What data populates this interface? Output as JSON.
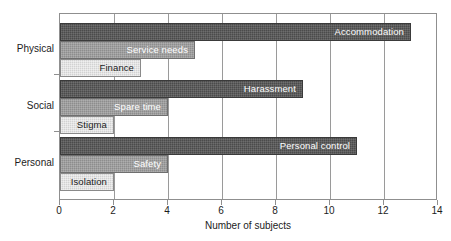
{
  "chart_data": {
    "type": "bar",
    "orientation": "horizontal",
    "title": "",
    "xlabel": "Number of subjects",
    "ylabel": "",
    "xlim": [
      0,
      14
    ],
    "xticks": [
      0,
      2,
      4,
      6,
      8,
      10,
      12,
      14
    ],
    "xticklabels": [
      "0",
      "2",
      "4",
      "6",
      "8",
      "10",
      "12",
      "14"
    ],
    "grid": "vertical",
    "legend": "none",
    "groups": [
      {
        "name": "Physical",
        "bars": [
          {
            "label": "Accommodation",
            "value": 13,
            "shade": "dark",
            "color": "#4b4b4b"
          },
          {
            "label": "Service needs",
            "value": 5,
            "shade": "mid",
            "color": "#8d8d8d"
          },
          {
            "label": "Finance",
            "value": 3,
            "shade": "light",
            "color": "#d2d2d2"
          }
        ]
      },
      {
        "name": "Social",
        "bars": [
          {
            "label": "Harassment",
            "value": 9,
            "shade": "dark",
            "color": "#4b4b4b"
          },
          {
            "label": "Spare time",
            "value": 4,
            "shade": "mid",
            "color": "#8d8d8d"
          },
          {
            "label": "Stigma",
            "value": 2,
            "shade": "light",
            "color": "#d2d2d2"
          }
        ]
      },
      {
        "name": "Personal",
        "bars": [
          {
            "label": "Personal control",
            "value": 11,
            "shade": "dark",
            "color": "#4b4b4b"
          },
          {
            "label": "Safety",
            "value": 4,
            "shade": "mid",
            "color": "#8d8d8d"
          },
          {
            "label": "Isolation",
            "value": 2,
            "shade": "light",
            "color": "#d2d2d2"
          }
        ]
      }
    ]
  },
  "axis": {
    "x_title": "Number of subjects",
    "tick_labels_x": [
      "0",
      "2",
      "4",
      "6",
      "8",
      "10",
      "12",
      "14"
    ],
    "category_labels": [
      "Physical",
      "Social",
      "Personal"
    ]
  }
}
